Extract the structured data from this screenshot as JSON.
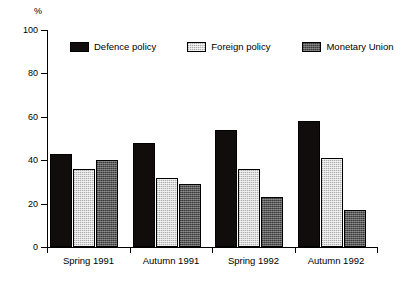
{
  "chart_data": {
    "type": "bar",
    "title": "",
    "xlabel": "",
    "ylabel": "%",
    "ylim": [
      0,
      100
    ],
    "yticks": [
      0,
      20,
      40,
      60,
      80,
      100
    ],
    "ytick_labels": [
      "0",
      "20",
      "40",
      "60",
      "80",
      "100"
    ],
    "grid": false,
    "legend_position": "top-inside",
    "categories": [
      "Spring 1991",
      "Autumn 1991",
      "Spring 1992",
      "Autumn 1992"
    ],
    "series": [
      {
        "name": "Defence policy",
        "color": "#120d0d",
        "values": [
          43,
          48,
          54,
          58
        ]
      },
      {
        "name": "Foreign policy",
        "color": "#d9d9d9",
        "values": [
          36,
          32,
          36,
          41
        ]
      },
      {
        "name": "Monetary Union",
        "color": "#595959",
        "values": [
          40,
          29,
          23,
          17
        ]
      }
    ]
  },
  "axis": {
    "unit_label": "%"
  },
  "legend": {
    "items": [
      {
        "label": "Defence policy"
      },
      {
        "label": "Foreign policy"
      },
      {
        "label": "Monetary Union"
      }
    ]
  }
}
